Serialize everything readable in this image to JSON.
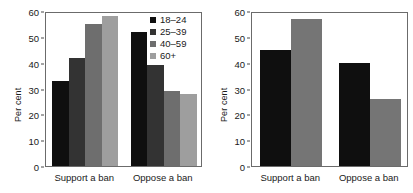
{
  "chart_data": [
    {
      "type": "bar",
      "title": "",
      "xlabel": "",
      "ylabel": "Per cent",
      "ylim": [
        0,
        60
      ],
      "yticks": [
        0,
        10,
        20,
        30,
        40,
        50,
        60
      ],
      "grid": false,
      "legend_position": "top-right",
      "categories": [
        "Support a ban",
        "Oppose a ban"
      ],
      "series": [
        {
          "name": "18–24",
          "color": "#0f0f0f",
          "values": [
            33,
            52
          ]
        },
        {
          "name": "25–39",
          "color": "#333333",
          "values": [
            42,
            39
          ]
        },
        {
          "name": "40–59",
          "color": "#6e6e6e",
          "values": [
            55,
            29
          ]
        },
        {
          "name": "60+",
          "color": "#9e9e9e",
          "values": [
            58,
            28
          ]
        }
      ]
    },
    {
      "type": "bar",
      "title": "",
      "xlabel": "",
      "ylabel": "Per cent",
      "ylim": [
        0,
        60
      ],
      "yticks": [
        0,
        10,
        20,
        30,
        40,
        50,
        60
      ],
      "grid": false,
      "legend_position": "top-right",
      "categories": [
        "Support a ban",
        "Oppose a ban"
      ],
      "series": [
        {
          "name": "Middle class",
          "color": "#0f0f0f",
          "values": [
            45,
            40
          ]
        },
        {
          "name": "Working class",
          "color": "#757575",
          "values": [
            57,
            26
          ]
        }
      ]
    }
  ]
}
